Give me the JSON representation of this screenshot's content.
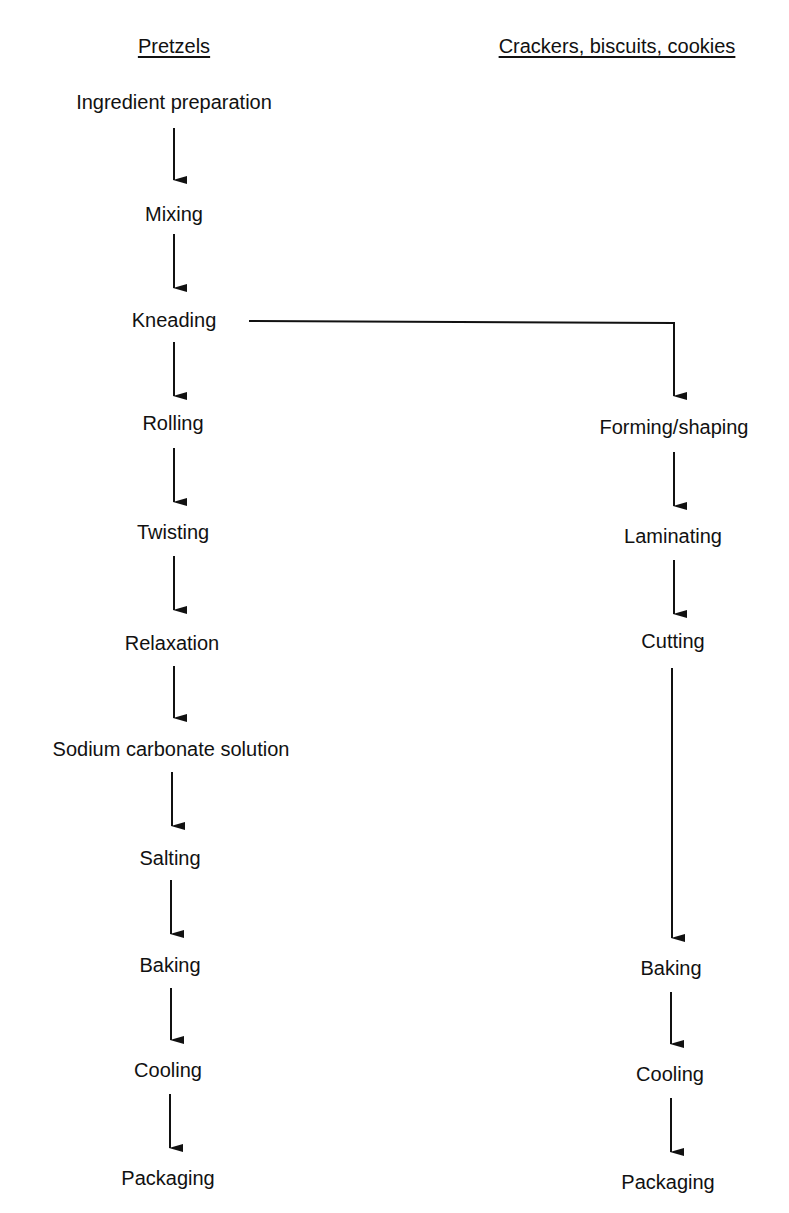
{
  "diagram": {
    "type": "flowchart",
    "columns": [
      {
        "header": "Pretzels",
        "steps": [
          "Ingredient preparation",
          "Mixing",
          "Kneading",
          "Rolling",
          "Twisting",
          "Relaxation",
          "Sodium carbonate solution",
          "Salting",
          "Baking",
          "Cooling",
          "Packaging"
        ]
      },
      {
        "header": "Crackers, biscuits, cookies",
        "steps": [
          "Forming/shaping",
          "Laminating",
          "Cutting",
          "Baking",
          "Cooling",
          "Packaging"
        ]
      }
    ],
    "branch": {
      "from": "Kneading",
      "to": "Forming/shaping"
    },
    "line_color": "#111111"
  }
}
